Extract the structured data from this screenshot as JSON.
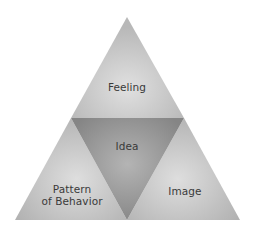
{
  "diagram": {
    "type": "triangle-quadrants",
    "sections": {
      "top": {
        "label": "Feeling"
      },
      "center": {
        "label": "Idea"
      },
      "bottom_left": {
        "label_line1": "Pattern",
        "label_line2": "of Behavior"
      },
      "bottom_right": {
        "label": "Image"
      }
    },
    "colors": {
      "outer_light": "#dedede",
      "outer_dark": "#b4b4b4",
      "inner_light": "#b0b0b0",
      "inner_dark": "#858585",
      "text": "#3a3a3a",
      "background": "#ffffff"
    }
  }
}
